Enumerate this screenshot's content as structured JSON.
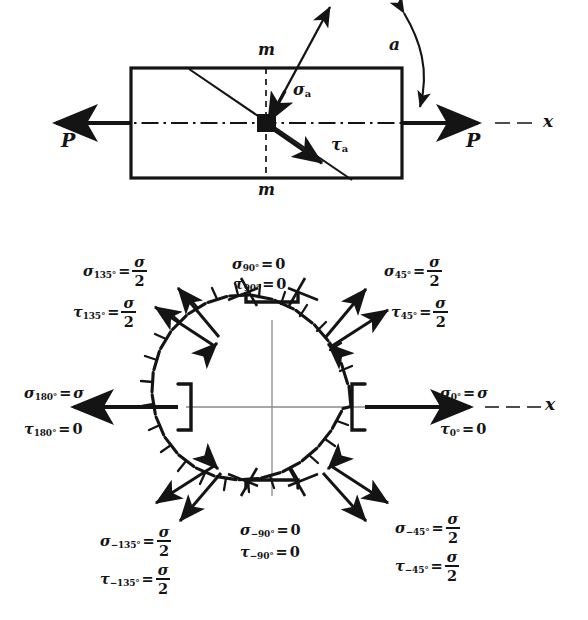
{
  "figure": {
    "top_diagram": {
      "name": "axially-loaded-bar",
      "labels": {
        "load_left": "P",
        "load_right": "P",
        "axis_x": "x",
        "section_top": "m",
        "section_bottom": "m",
        "normal_stress": "σ",
        "normal_stress_sub": "a",
        "shear_stress": "τ",
        "shear_stress_sub": "a",
        "angle": "a"
      }
    },
    "bottom_diagram": {
      "name": "stress-circle",
      "stress_labels": [
        {
          "id": "deg-135",
          "angle_deg": 135,
          "sigma": {
            "symbol": "σ",
            "sub": "135°",
            "op": "=",
            "value_num": "σ",
            "value_den": "2",
            "is_fraction": true
          },
          "tau": {
            "symbol": "τ",
            "sub": "135°",
            "op": "=",
            "value_num": "σ",
            "value_den": "2",
            "is_fraction": true
          }
        },
        {
          "id": "deg-90",
          "angle_deg": 90,
          "sigma": {
            "symbol": "σ",
            "sub": "90°",
            "op": "=",
            "value": "0",
            "is_fraction": false
          },
          "tau": {
            "symbol": "τ",
            "sub": "90°",
            "op": "=",
            "value": "0",
            "is_fraction": false
          }
        },
        {
          "id": "deg-45",
          "angle_deg": 45,
          "sigma": {
            "symbol": "σ",
            "sub": "45°",
            "op": "=",
            "value_num": "σ",
            "value_den": "2",
            "is_fraction": true
          },
          "tau": {
            "symbol": "τ",
            "sub": "45°",
            "op": "=",
            "value_num": "σ",
            "value_den": "2",
            "is_fraction": true
          }
        },
        {
          "id": "deg-180",
          "angle_deg": 180,
          "sigma": {
            "symbol": "σ",
            "sub": "180°",
            "op": "=",
            "value": "σ",
            "is_fraction": false
          },
          "tau": {
            "symbol": "τ",
            "sub": "180°",
            "op": "=",
            "value": "0",
            "is_fraction": false
          }
        },
        {
          "id": "deg-0",
          "angle_deg": 0,
          "sigma": {
            "symbol": "σ",
            "sub": "0°",
            "op": "=",
            "value": "σ",
            "is_fraction": false
          },
          "tau": {
            "symbol": "τ",
            "sub": "0°",
            "op": "=",
            "value": "0",
            "is_fraction": false
          }
        },
        {
          "id": "deg-minus-135",
          "angle_deg": -135,
          "sigma": {
            "symbol": "σ",
            "sub": "−135°",
            "op": "=",
            "value_num": "σ",
            "value_den": "2",
            "is_fraction": true
          },
          "tau": {
            "symbol": "τ",
            "sub": "−135°",
            "op": "=",
            "value_num": "σ",
            "value_den": "2",
            "is_fraction": true
          }
        },
        {
          "id": "deg-minus-90",
          "angle_deg": -90,
          "sigma": {
            "symbol": "σ",
            "sub": "−90°",
            "op": "=",
            "value": "0",
            "is_fraction": false
          },
          "tau": {
            "symbol": "τ",
            "sub": "−90°",
            "op": "=",
            "value": "0",
            "is_fraction": false
          }
        },
        {
          "id": "deg-minus-45",
          "angle_deg": -45,
          "sigma": {
            "symbol": "σ",
            "sub": "−45°",
            "op": "=",
            "value_num": "σ",
            "value_den": "2",
            "is_fraction": true
          },
          "tau": {
            "symbol": "τ",
            "sub": "−45°",
            "op": "=",
            "value_num": "σ",
            "value_den": "2",
            "is_fraction": true
          }
        }
      ],
      "axis_x": "x"
    },
    "colors": {
      "ink": "#141414",
      "thin_ink": "#6b6b6b",
      "paper": "#ffffff"
    }
  }
}
